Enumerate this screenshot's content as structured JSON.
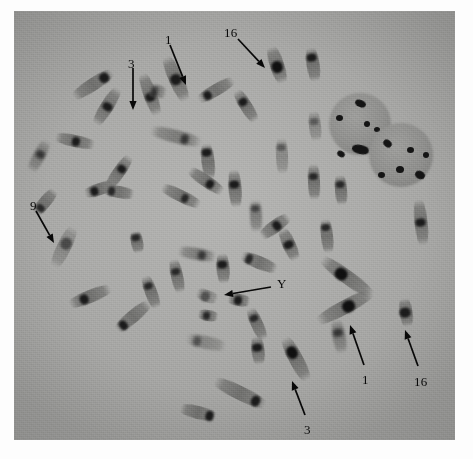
{
  "figure": {
    "kind": "chromosome-metaphase-spread-micrograph",
    "technique": "C-banding",
    "caption_partial": "",
    "background_color": "#a8a8a6",
    "ink_color": "#0a0a0a",
    "band_color": "#1d1d1d",
    "plate": {
      "x": 14,
      "y": 11,
      "width": 441,
      "height": 429
    }
  },
  "annotations": [
    {
      "id": "label-3-top",
      "text": "3",
      "label_x": 128,
      "label_y": 57,
      "ax1": 133,
      "ay1": 68,
      "ax2": 133,
      "ay2": 110,
      "desc": "arrow down to chromosome 3"
    },
    {
      "id": "label-1-top",
      "text": "1",
      "label_x": 165,
      "label_y": 33,
      "ax1": 170,
      "ay1": 45,
      "ax2": 186,
      "ay2": 85,
      "desc": "arrow down-right to chromosome 1"
    },
    {
      "id": "label-16-top",
      "text": "16",
      "label_x": 224,
      "label_y": 26,
      "ax1": 238,
      "ay1": 39,
      "ax2": 265,
      "ay2": 68,
      "desc": "arrow down-right to chromosome 16"
    },
    {
      "id": "label-9-left",
      "text": "9",
      "label_x": 30,
      "label_y": 199,
      "ax1": 36,
      "ay1": 211,
      "ax2": 54,
      "ay2": 243,
      "desc": "arrow down-right to chromosome 9"
    },
    {
      "id": "label-Y-center",
      "text": "Y",
      "label_x": 277,
      "label_y": 277,
      "ax1": 271,
      "ay1": 287,
      "ax2": 224,
      "ay2": 295,
      "desc": "arrow left to Y chromosome"
    },
    {
      "id": "label-1-bottom",
      "text": "1",
      "label_x": 362,
      "label_y": 373,
      "ax1": 364,
      "ay1": 365,
      "ax2": 350,
      "ay2": 325,
      "desc": "arrow up-left to chromosome 1"
    },
    {
      "id": "label-16-bottom",
      "text": "16",
      "label_x": 414,
      "label_y": 375,
      "ax1": 418,
      "ay1": 366,
      "ax2": 405,
      "ay2": 330,
      "desc": "arrow up-left to chromosome 16"
    },
    {
      "id": "label-3-bottom",
      "text": "3",
      "label_x": 304,
      "label_y": 423,
      "ax1": 305,
      "ay1": 415,
      "ax2": 292,
      "ay2": 381,
      "desc": "arrow up-left to chromosome 3"
    }
  ],
  "nuclei": [
    {
      "id": "nucleus-upper",
      "cx": 360,
      "cy": 124,
      "r": 31,
      "spots": [
        {
          "x": 355,
          "y": 100,
          "w": 11,
          "h": 7,
          "rot": 22
        },
        {
          "x": 336,
          "y": 115,
          "w": 7,
          "h": 6,
          "rot": 0
        },
        {
          "x": 364,
          "y": 121,
          "w": 6,
          "h": 6,
          "rot": 0
        },
        {
          "x": 374,
          "y": 127,
          "w": 6,
          "h": 5,
          "rot": 0
        },
        {
          "x": 352,
          "y": 145,
          "w": 17,
          "h": 9,
          "rot": 12
        },
        {
          "x": 337,
          "y": 151,
          "w": 8,
          "h": 6,
          "rot": 30
        }
      ]
    },
    {
      "id": "nucleus-lower",
      "cx": 401,
      "cy": 155,
      "r": 32,
      "spots": [
        {
          "x": 383,
          "y": 140,
          "w": 9,
          "h": 7,
          "rot": 40
        },
        {
          "x": 407,
          "y": 147,
          "w": 7,
          "h": 6,
          "rot": 0
        },
        {
          "x": 396,
          "y": 166,
          "w": 8,
          "h": 7,
          "rot": 0
        },
        {
          "x": 378,
          "y": 172,
          "w": 7,
          "h": 6,
          "rot": 0
        },
        {
          "x": 415,
          "y": 171,
          "w": 10,
          "h": 8,
          "rot": 25
        },
        {
          "x": 423,
          "y": 152,
          "w": 6,
          "h": 6,
          "rot": 0
        }
      ]
    }
  ],
  "chromosomes": [
    {
      "x": 70,
      "y": 78,
      "w": 46,
      "h": 13,
      "rot": -33,
      "band": {
        "o": 0.78,
        "w": 10,
        "h": 13
      }
    },
    {
      "x": 86,
      "y": 100,
      "w": 42,
      "h": 13,
      "rot": -58,
      "band": {
        "o": 0.5,
        "w": 8,
        "h": 13
      }
    },
    {
      "x": 55,
      "y": 135,
      "w": 40,
      "h": 12,
      "rot": 12,
      "band": {
        "o": 0.52,
        "w": 8,
        "h": 12
      }
    },
    {
      "x": 22,
      "y": 150,
      "w": 34,
      "h": 12,
      "rot": -62,
      "band": {
        "o": 0.55,
        "w": 8,
        "h": 12
      }
    },
    {
      "x": 84,
      "y": 183,
      "w": 32,
      "h": 12,
      "rot": -18,
      "band": {
        "o": 0.3,
        "w": 8,
        "h": 12
      }
    },
    {
      "x": 42,
      "y": 240,
      "w": 44,
      "h": 14,
      "rot": -64,
      "band": {
        "o": 0.58,
        "w": 12,
        "h": 14
      }
    },
    {
      "x": 68,
      "y": 290,
      "w": 44,
      "h": 13,
      "rot": -22,
      "band": {
        "o": 0.36,
        "w": 9,
        "h": 13
      }
    },
    {
      "x": 112,
      "y": 310,
      "w": 42,
      "h": 13,
      "rot": -40,
      "band": {
        "o": 0.2,
        "w": 8,
        "h": 13
      }
    },
    {
      "x": 128,
      "y": 88,
      "w": 44,
      "h": 13,
      "rot": 70,
      "band": {
        "o": 0.56,
        "w": 9,
        "h": 13
      }
    },
    {
      "x": 100,
      "y": 166,
      "w": 38,
      "h": 12,
      "rot": -55,
      "band": {
        "o": 0.6,
        "w": 8,
        "h": 12
      }
    },
    {
      "x": 148,
      "y": 85,
      "w": 18,
      "h": 13,
      "rot": 12,
      "band": {
        "o": 0.35,
        "w": 7,
        "h": 13
      }
    },
    {
      "x": 152,
      "y": 72,
      "w": 48,
      "h": 14,
      "rot": 66,
      "band": {
        "o": 0.52,
        "w": 11,
        "h": 14
      }
    },
    {
      "x": 196,
      "y": 84,
      "w": 40,
      "h": 12,
      "rot": -30,
      "band": {
        "o": 0.26,
        "w": 8,
        "h": 12
      }
    },
    {
      "x": 228,
      "y": 100,
      "w": 36,
      "h": 12,
      "rot": 58,
      "band": {
        "o": 0.36,
        "w": 8,
        "h": 12
      }
    },
    {
      "x": 258,
      "y": 58,
      "w": 38,
      "h": 14,
      "rot": 72,
      "band": {
        "o": 0.55,
        "w": 12,
        "h": 14
      }
    },
    {
      "x": 296,
      "y": 58,
      "w": 34,
      "h": 13,
      "rot": 82,
      "band": {
        "o": 0.28,
        "w": 8,
        "h": 13
      }
    },
    {
      "x": 300,
      "y": 120,
      "w": 30,
      "h": 12,
      "rot": 84,
      "band": {
        "o": 0.36,
        "w": 7,
        "h": 12
      }
    },
    {
      "x": 150,
      "y": 130,
      "w": 52,
      "h": 13,
      "rot": 14,
      "band": {
        "o": 0.68,
        "w": 8,
        "h": 13
      }
    },
    {
      "x": 160,
      "y": 190,
      "w": 42,
      "h": 12,
      "rot": 26,
      "band": {
        "o": 0.6,
        "w": 7,
        "h": 12
      }
    },
    {
      "x": 104,
      "y": 186,
      "w": 30,
      "h": 12,
      "rot": 10,
      "band": {
        "o": 0.25,
        "w": 7,
        "h": 12
      }
    },
    {
      "x": 186,
      "y": 175,
      "w": 40,
      "h": 12,
      "rot": 34,
      "band": {
        "o": 0.62,
        "w": 8,
        "h": 12
      }
    },
    {
      "x": 190,
      "y": 155,
      "w": 36,
      "h": 13,
      "rot": 84,
      "band": {
        "o": 0.25,
        "w": 8,
        "h": 13
      }
    },
    {
      "x": 216,
      "y": 182,
      "w": 38,
      "h": 13,
      "rot": 86,
      "band": {
        "o": 0.4,
        "w": 8,
        "h": 13
      }
    },
    {
      "x": 126,
      "y": 236,
      "w": 22,
      "h": 12,
      "rot": 80,
      "band": {
        "o": 0.3,
        "w": 7,
        "h": 12
      }
    },
    {
      "x": 178,
      "y": 248,
      "w": 38,
      "h": 12,
      "rot": 10,
      "band": {
        "o": 0.62,
        "w": 8,
        "h": 12
      }
    },
    {
      "x": 160,
      "y": 270,
      "w": 34,
      "h": 12,
      "rot": 78,
      "band": {
        "o": 0.38,
        "w": 7,
        "h": 12
      }
    },
    {
      "x": 134,
      "y": 286,
      "w": 34,
      "h": 12,
      "rot": 70,
      "band": {
        "o": 0.3,
        "w": 7,
        "h": 12
      }
    },
    {
      "x": 196,
      "y": 290,
      "w": 22,
      "h": 12,
      "rot": 20,
      "band": {
        "o": 0.45,
        "w": 9,
        "h": 13
      }
    },
    {
      "x": 198,
      "y": 310,
      "w": 20,
      "h": 11,
      "rot": 10,
      "band": {
        "o": 0.4,
        "w": 7,
        "h": 11
      }
    },
    {
      "x": 208,
      "y": 262,
      "w": 30,
      "h": 13,
      "rot": 86,
      "band": {
        "o": 0.38,
        "w": 8,
        "h": 13
      }
    },
    {
      "x": 240,
      "y": 256,
      "w": 38,
      "h": 13,
      "rot": 22,
      "band": {
        "o": 0.22,
        "w": 7,
        "h": 13
      }
    },
    {
      "x": 240,
      "y": 210,
      "w": 32,
      "h": 12,
      "rot": 88,
      "band": {
        "o": 0.28,
        "w": 7,
        "h": 12
      }
    },
    {
      "x": 258,
      "y": 220,
      "w": 34,
      "h": 13,
      "rot": -36,
      "band": {
        "o": 0.56,
        "w": 8,
        "h": 13
      }
    },
    {
      "x": 272,
      "y": 238,
      "w": 34,
      "h": 13,
      "rot": 66,
      "band": {
        "o": 0.5,
        "w": 8,
        "h": 13
      }
    },
    {
      "x": 296,
      "y": 176,
      "w": 36,
      "h": 12,
      "rot": 88,
      "band": {
        "o": 0.35,
        "w": 7,
        "h": 12
      }
    },
    {
      "x": 326,
      "y": 184,
      "w": 30,
      "h": 12,
      "rot": 86,
      "band": {
        "o": 0.33,
        "w": 7,
        "h": 12
      }
    },
    {
      "x": 228,
      "y": 294,
      "w": 22,
      "h": 12,
      "rot": 10,
      "band": {
        "o": 0.44,
        "w": 8,
        "h": 12
      }
    },
    {
      "x": 240,
      "y": 318,
      "w": 34,
      "h": 12,
      "rot": 66,
      "band": {
        "o": 0.3,
        "w": 7,
        "h": 12
      }
    },
    {
      "x": 186,
      "y": 336,
      "w": 40,
      "h": 13,
      "rot": 12,
      "band": {
        "o": 0.28,
        "w": 8,
        "h": 13
      }
    },
    {
      "x": 244,
      "y": 344,
      "w": 28,
      "h": 13,
      "rot": 84,
      "band": {
        "o": 0.4,
        "w": 8,
        "h": 13
      }
    },
    {
      "x": 272,
      "y": 352,
      "w": 48,
      "h": 14,
      "rot": 62,
      "band": {
        "o": 0.34,
        "w": 13,
        "h": 14
      }
    },
    {
      "x": 212,
      "y": 386,
      "w": 56,
      "h": 14,
      "rot": 26,
      "band": {
        "o": 0.82,
        "w": 9,
        "h": 14
      }
    },
    {
      "x": 180,
      "y": 406,
      "w": 36,
      "h": 13,
      "rot": 14,
      "band": {
        "o": 0.82,
        "w": 8,
        "h": 13
      }
    },
    {
      "x": 316,
      "y": 270,
      "w": 62,
      "h": 14,
      "rot": 36,
      "band": {
        "o": 0.4,
        "w": 13,
        "h": 15
      }
    },
    {
      "x": 314,
      "y": 300,
      "w": 62,
      "h": 14,
      "rot": -28,
      "band": {
        "o": 0.55,
        "w": 13,
        "h": 15
      }
    },
    {
      "x": 322,
      "y": 330,
      "w": 34,
      "h": 13,
      "rot": 80,
      "band": {
        "o": 0.38,
        "w": 8,
        "h": 13
      }
    },
    {
      "x": 392,
      "y": 306,
      "w": 28,
      "h": 13,
      "rot": 82,
      "band": {
        "o": 0.5,
        "w": 10,
        "h": 14
      }
    },
    {
      "x": 398,
      "y": 216,
      "w": 46,
      "h": 13,
      "rot": 84,
      "band": {
        "o": 0.5,
        "w": 8,
        "h": 13
      }
    },
    {
      "x": 310,
      "y": 230,
      "w": 34,
      "h": 12,
      "rot": 84,
      "band": {
        "o": 0.26,
        "w": 7,
        "h": 12
      }
    },
    {
      "x": 264,
      "y": 150,
      "w": 36,
      "h": 12,
      "rot": 88,
      "band": {
        "o": 0.26,
        "w": 7,
        "h": 12
      }
    },
    {
      "x": 30,
      "y": 196,
      "w": 30,
      "h": 12,
      "rot": -50,
      "band": {
        "o": 0.25,
        "w": 7,
        "h": 12
      }
    }
  ]
}
